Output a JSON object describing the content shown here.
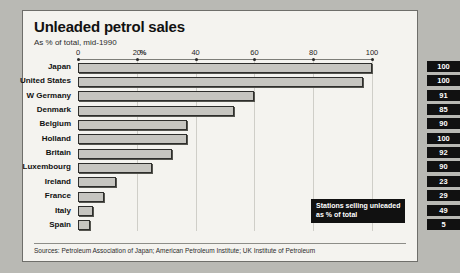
{
  "header": {
    "title": "Unleaded petrol sales",
    "subtitle": "As % of total, mid-1990"
  },
  "annotation": {
    "line1": "Stations selling unleaded",
    "line2": "as % of total"
  },
  "footer": {
    "source": "Sources: Petroleum Association of Japan; American Petroleum Institute; UK Institute of Petroleum"
  },
  "axis": {
    "unit_label": "%",
    "tick_labels": [
      "0",
      "20",
      "40",
      "60",
      "80",
      "100"
    ]
  },
  "chart_data": {
    "type": "bar",
    "orientation": "horizontal",
    "title": "Unleaded petrol sales",
    "subtitle": "As % of total, mid-1990",
    "xlabel": "%",
    "ylabel": "",
    "xlim": [
      0,
      100
    ],
    "xticks": [
      0,
      20,
      40,
      60,
      80,
      100
    ],
    "grid": true,
    "legend": false,
    "categories": [
      "Japan",
      "United States",
      "W Germany",
      "Denmark",
      "Belgium",
      "Holland",
      "Britain",
      "Luxembourg",
      "Ireland",
      "France",
      "Italy",
      "Spain"
    ],
    "series": [
      {
        "name": "Unleaded petrol sales as % of total",
        "values": [
          100,
          97,
          60,
          53,
          37,
          37,
          32,
          25,
          13,
          9,
          5,
          4
        ]
      },
      {
        "name": "Stations selling unleaded as % of total",
        "display": "value-box",
        "values": [
          100,
          100,
          91,
          85,
          90,
          100,
          92,
          90,
          23,
          29,
          49,
          5
        ]
      }
    ],
    "annotations": [
      {
        "text": "Stations selling unleaded as % of total",
        "points_to": "value-box-column"
      }
    ]
  },
  "colors": {
    "page_background": "#b9b9b4",
    "panel_background": "#f4f3ef",
    "bar_fill": "#c6c5c0",
    "bar_border": "#2e2e2c",
    "value_box": "#111111",
    "value_text": "#ffffff"
  }
}
